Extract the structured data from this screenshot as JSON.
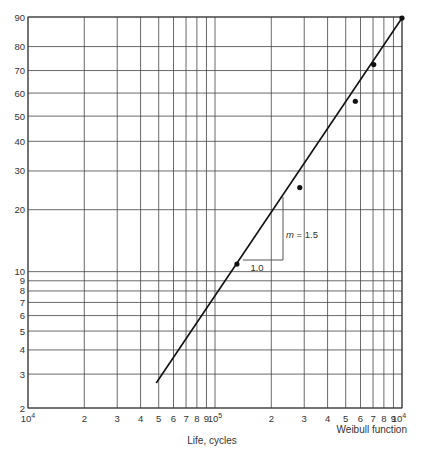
{
  "chart_data": {
    "type": "scatter",
    "title": "",
    "xlabel": "Life, cycles",
    "ylabel": "",
    "caption": "Weibull function",
    "x_scale": "log",
    "y_scale": "weibull",
    "xlim": [
      10000,
      1000000
    ],
    "ylim": [
      2,
      90
    ],
    "grid": true,
    "x_ticks": [
      {
        "value": 10000,
        "label": "10",
        "sup": "4"
      },
      {
        "value": 20000,
        "label": "2"
      },
      {
        "value": 30000,
        "label": "3"
      },
      {
        "value": 40000,
        "label": "4"
      },
      {
        "value": 50000,
        "label": "5"
      },
      {
        "value": 60000,
        "label": "6"
      },
      {
        "value": 70000,
        "label": "7"
      },
      {
        "value": 80000,
        "label": "8"
      },
      {
        "value": 90000,
        "label": "9"
      },
      {
        "value": 100000,
        "label": "10",
        "sup": "5"
      },
      {
        "value": 200000,
        "label": "2"
      },
      {
        "value": 300000,
        "label": "3"
      },
      {
        "value": 400000,
        "label": "4"
      },
      {
        "value": 500000,
        "label": "5"
      },
      {
        "value": 600000,
        "label": "6"
      },
      {
        "value": 700000,
        "label": "7"
      },
      {
        "value": 800000,
        "label": "8"
      },
      {
        "value": 900000,
        "label": "9"
      },
      {
        "value": 1000000,
        "label": "10",
        "sup": "4"
      }
    ],
    "y_ticks": [
      2,
      3,
      4,
      5,
      6,
      7,
      8,
      9,
      10,
      20,
      30,
      40,
      50,
      60,
      70,
      80,
      90
    ],
    "series": [
      {
        "name": "Test data",
        "type": "scatter",
        "x": [
          131000,
          284000,
          563000,
          706000,
          1000000
        ],
        "y": [
          10.9,
          25.3,
          56.4,
          72.6,
          89.7
        ]
      },
      {
        "name": "Weibull fit",
        "type": "line",
        "x": [
          48500,
          1000000
        ],
        "y": [
          2.7,
          89.7
        ]
      }
    ],
    "annotations": [
      {
        "text_italic": "m",
        "text": " = 1.5",
        "type": "slope-rise"
      },
      {
        "text": "1.0",
        "type": "slope-run"
      }
    ]
  }
}
